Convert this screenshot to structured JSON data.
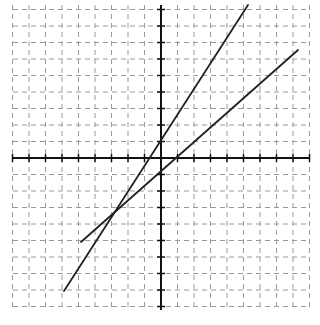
{
  "chart_data": {
    "type": "line",
    "title": "",
    "xlabel": "",
    "ylabel": "",
    "grid": true,
    "grid_style": "dashed",
    "xlim": [
      -9,
      9
    ],
    "ylim": [
      -9,
      9
    ],
    "tick_step": 1,
    "series": [
      {
        "name": "line-1",
        "equation": "y = 1.5x + 1",
        "x": [
          -5.9,
          5.3
        ],
        "y": [
          -7.9,
          9.0
        ],
        "color": "#222222"
      },
      {
        "name": "line-2",
        "equation": "y = x - 1 (approx)",
        "x": [
          -4.85,
          8.3
        ],
        "y": [
          -5.1,
          6.6
        ],
        "color": "#222222"
      }
    ],
    "segments_px": [
      {
        "x1": 64,
        "y1": 291,
        "x2": 248,
        "y2": 5
      },
      {
        "x1": 81,
        "y1": 242,
        "x2": 298,
        "y2": 50
      }
    ]
  },
  "layout": {
    "origin_px": [
      161,
      158
    ],
    "unit_px": 16.5,
    "x_axis_px": [
      13,
      310
    ],
    "y_axis_px": [
      5,
      310
    ],
    "colors": {
      "grid": "#9a9a9a",
      "axis": "#111111",
      "line": "#222222",
      "background": "#ffffff"
    }
  }
}
